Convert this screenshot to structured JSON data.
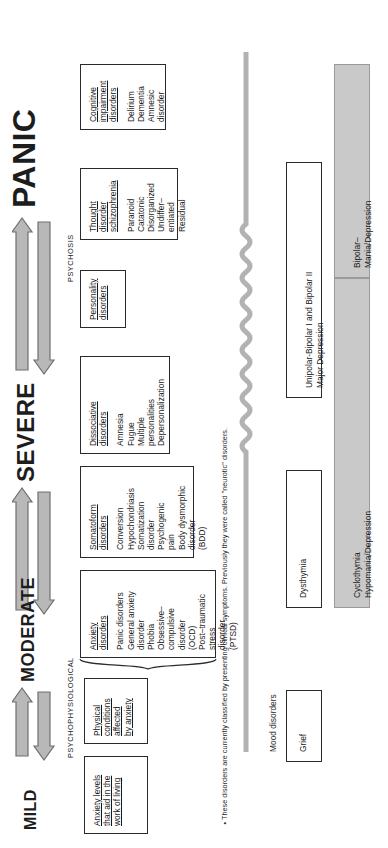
{
  "scale": {
    "levels": [
      "MILD",
      "MODERATE",
      "SEVERE",
      "PANIC"
    ],
    "section_labels": [
      "PSYCHOPHYSIOLOGICAL",
      "PSYCHOSIS"
    ]
  },
  "boxes": [
    {
      "id": "anxiety-levels",
      "heading": [
        "Anxiety levels",
        "that aid in the",
        "work of living"
      ],
      "items": []
    },
    {
      "id": "physical-conditions",
      "heading": [
        "Physical",
        "conditions",
        "affected",
        "by anxiety"
      ],
      "items": []
    },
    {
      "id": "anxiety-disorders",
      "heading": [
        "Anxiety",
        "disorders"
      ],
      "items": [
        "Panic disorders",
        "General anxiety",
        "disorder",
        "Phobia",
        "Obsessive–",
        "compulsive",
        "disorder",
        "(OCD)",
        "Post–traumatic",
        "stress",
        "disorder",
        "(PTSD)"
      ]
    },
    {
      "id": "somatoform-disorders",
      "heading": [
        "Somatoform",
        "disorders"
      ],
      "items": [
        "Conversion",
        "Hypochondriasis",
        "Somatization",
        "disorder",
        "Psychogenic",
        "pain",
        "Body dysmorphic",
        "disorder",
        "(BDD)"
      ]
    },
    {
      "id": "dissociative-disorders",
      "heading": [
        "Dissociative",
        "disorders"
      ],
      "items": [
        "Amnesia",
        "Fugue",
        "Multiple",
        "personalities",
        "Depersonalization"
      ]
    },
    {
      "id": "personality-disorders",
      "heading": [
        "Personality",
        "disorders"
      ],
      "items": []
    },
    {
      "id": "thought-disorder",
      "heading": [
        "Thought",
        "disorder",
        "schizophrenia"
      ],
      "items": [
        "Paranoid",
        "Catatonic",
        "Disorganized",
        "Undiffer–",
        "entiated",
        "Residual"
      ]
    },
    {
      "id": "cognitive-impairment",
      "heading": [
        "Cognitive",
        "impairment",
        "disorders"
      ],
      "items": [
        "Delirium",
        "Dementia",
        "Amnesic",
        "disorder"
      ]
    }
  ],
  "mood": {
    "axis_label": "Mood disorders",
    "unipolar_row": [
      {
        "id": "grief",
        "text": "Grief",
        "shaded": false
      },
      {
        "id": "dysthymia",
        "text": "Dysthymia",
        "shaded": false
      },
      {
        "id": "unipolar-major",
        "text": "Unipolar-Bipolar I and Bipolar II\nMajor Depression",
        "shaded": false
      }
    ],
    "bipolar_row": [
      {
        "id": "cyclothymia",
        "text": "Cyclothymia\nHypomania/Depression",
        "shaded": true
      },
      {
        "id": "bipolar-mania",
        "text": "Bipolar–\nMania/Depression",
        "shaded": true
      }
    ]
  },
  "footnote": "• These disorders are currently classified by presenting clinical symptoms. Previously they were called ''neurotic'' disorders.",
  "colors": {
    "ink": "#1f1f1f",
    "box_border": "#2b2b2b",
    "arrow_fill": "#b8b8b8",
    "arrow_stroke": "#6f6f6f",
    "shaded_fill": "#c9c9c9",
    "squiggle": "#b2b2b2"
  }
}
